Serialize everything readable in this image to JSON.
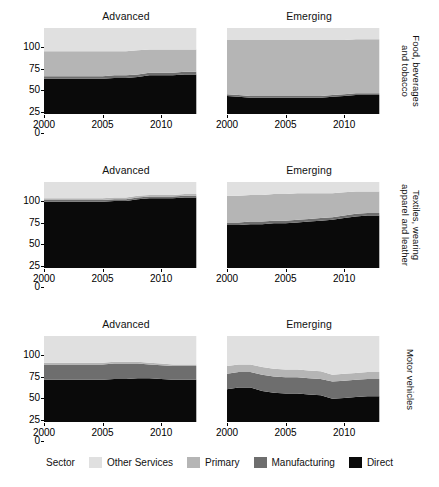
{
  "figure": {
    "column_titles": [
      "Advanced",
      "Emerging"
    ],
    "row_titles": [
      "Food, beverages\nand tobacco",
      "Textiles, wearing\napparel and leather",
      "Motor vehicles"
    ],
    "legend_title": "Sector"
  },
  "chart_data": {
    "type": "area",
    "title": "",
    "xlabel": "",
    "ylabel": "",
    "xlim": [
      2000,
      2014
    ],
    "ylim": [
      0,
      100
    ],
    "xticks": [
      2000,
      2005,
      2010
    ],
    "yticks": [
      0,
      25,
      50,
      75,
      100
    ],
    "grid": false,
    "stacked": true,
    "legend_position": "bottom",
    "legend_title": "Sector",
    "series_order": [
      "Direct",
      "Manufacturing",
      "Primary",
      "Other Services"
    ],
    "colors": {
      "Other Services": "#e0e0e0",
      "Primary": "#b5b5b5",
      "Manufacturing": "#6e6e6e",
      "Direct": "#0a0a0a"
    },
    "x": [
      2000,
      2001,
      2002,
      2003,
      2004,
      2005,
      2006,
      2007,
      2008,
      2009,
      2010,
      2011,
      2012,
      2013
    ],
    "panels": [
      {
        "row": "Food, beverages and tobacco",
        "column": "Advanced",
        "series": [
          {
            "name": "Direct",
            "values": [
              41,
              41,
              41,
              41,
              41,
              41,
              42,
              42,
              43,
              45,
              45,
              45,
              46,
              46
            ]
          },
          {
            "name": "Manufacturing",
            "values": [
              3,
              3,
              3,
              3,
              3,
              3,
              3,
              3,
              3,
              3,
              3,
              3,
              3,
              3
            ]
          },
          {
            "name": "Primary",
            "values": [
              29,
              29,
              29,
              29,
              29,
              29,
              28,
              28,
              28,
              27,
              27,
              27,
              26,
              26
            ]
          },
          {
            "name": "Other Services",
            "values": [
              27,
              27,
              27,
              27,
              27,
              27,
              27,
              27,
              26,
              25,
              25,
              25,
              25,
              25
            ]
          }
        ]
      },
      {
        "row": "Food, beverages and tobacco",
        "column": "Emerging",
        "series": [
          {
            "name": "Direct",
            "values": [
              21,
              20,
              19,
              19,
              19,
              19,
              19,
              19,
              19,
              20,
              21,
              22,
              22,
              22
            ]
          },
          {
            "name": "Manufacturing",
            "values": [
              2,
              2,
              2,
              2,
              2,
              2,
              2,
              2,
              2,
              2,
              2,
              2,
              2,
              2
            ]
          },
          {
            "name": "Primary",
            "values": [
              63,
              64,
              65,
              65,
              65,
              65,
              65,
              65,
              65,
              64,
              63,
              63,
              63,
              63
            ]
          },
          {
            "name": "Other Services",
            "values": [
              14,
              14,
              14,
              14,
              14,
              14,
              14,
              14,
              14,
              14,
              14,
              13,
              13,
              13
            ]
          }
        ]
      },
      {
        "row": "Textiles, wearing apparel and leather",
        "column": "Advanced",
        "series": [
          {
            "name": "Direct",
            "values": [
              77,
              77,
              77,
              77,
              77,
              77,
              78,
              78,
              80,
              81,
              81,
              81,
              82,
              82
            ]
          },
          {
            "name": "Manufacturing",
            "values": [
              2,
              2,
              2,
              2,
              2,
              2,
              2,
              2,
              2,
              2,
              2,
              2,
              2,
              2
            ]
          },
          {
            "name": "Primary",
            "values": [
              2,
              2,
              2,
              2,
              2,
              2,
              2,
              2,
              2,
              2,
              2,
              2,
              2,
              2
            ]
          },
          {
            "name": "Other Services",
            "values": [
              19,
              19,
              19,
              19,
              19,
              19,
              18,
              18,
              16,
              15,
              15,
              15,
              14,
              14
            ]
          }
        ]
      },
      {
        "row": "Textiles, wearing apparel and leather",
        "column": "Emerging",
        "series": [
          {
            "name": "Direct",
            "values": [
              50,
              50,
              51,
              51,
              52,
              52,
              53,
              54,
              55,
              56,
              58,
              60,
              61,
              61
            ]
          },
          {
            "name": "Manufacturing",
            "values": [
              3,
              3,
              3,
              3,
              3,
              3,
              3,
              3,
              3,
              3,
              3,
              3,
              3,
              3
            ]
          },
          {
            "name": "Primary",
            "values": [
              31,
              31,
              31,
              31,
              31,
              31,
              31,
              30,
              29,
              28,
              27,
              26,
              25,
              25
            ]
          },
          {
            "name": "Other Services",
            "values": [
              16,
              16,
              15,
              15,
              14,
              14,
              13,
              13,
              13,
              13,
              12,
              11,
              11,
              11
            ]
          }
        ]
      },
      {
        "row": "Motor vehicles",
        "column": "Advanced",
        "series": [
          {
            "name": "Direct",
            "values": [
              49,
              49,
              49,
              49,
              49,
              49,
              50,
              50,
              51,
              51,
              50,
              49,
              49,
              49
            ]
          },
          {
            "name": "Manufacturing",
            "values": [
              18,
              18,
              18,
              18,
              18,
              18,
              18,
              18,
              17,
              16,
              16,
              16,
              16,
              16
            ]
          },
          {
            "name": "Primary",
            "values": [
              2,
              2,
              2,
              2,
              2,
              2,
              2,
              2,
              2,
              2,
              2,
              2,
              2,
              2
            ]
          },
          {
            "name": "Other Services",
            "values": [
              31,
              31,
              31,
              31,
              31,
              31,
              30,
              30,
              30,
              31,
              32,
              33,
              33,
              33
            ]
          }
        ]
      },
      {
        "row": "Motor vehicles",
        "column": "Emerging",
        "series": [
          {
            "name": "Direct",
            "values": [
              38,
              40,
              40,
              36,
              34,
              33,
              33,
              32,
              31,
              27,
              28,
              29,
              30,
              30
            ]
          },
          {
            "name": "Manufacturing",
            "values": [
              18,
              18,
              18,
              19,
              19,
              19,
              19,
              19,
              19,
              20,
              20,
              20,
              20,
              20
            ]
          },
          {
            "name": "Primary",
            "values": [
              9,
              9,
              9,
              9,
              9,
              9,
              9,
              9,
              9,
              8,
              8,
              8,
              8,
              8
            ]
          },
          {
            "name": "Other Services",
            "values": [
              35,
              33,
              33,
              36,
              38,
              39,
              39,
              40,
              41,
              45,
              44,
              43,
              42,
              42
            ]
          }
        ]
      }
    ]
  }
}
